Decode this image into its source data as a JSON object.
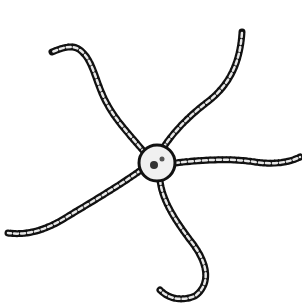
{
  "image": {
    "subject": "Brittle star illustration",
    "background": "#ffffff",
    "ink_color": "#111111",
    "disc": {
      "cx": 157,
      "cy": 163,
      "r": 18
    },
    "arms": [
      {
        "name": "upper-left",
        "path": "M145,153 C130,135 115,120 105,100 C95,80 93,60 80,50 C72,44 62,48 52,52"
      },
      {
        "name": "upper-right",
        "path": "M163,148 C175,130 190,115 210,100 C228,85 240,65 242,32"
      },
      {
        "name": "right",
        "path": "M175,163 C200,160 230,158 255,162 C275,165 290,162 300,157"
      },
      {
        "name": "lower",
        "path": "M160,180 C162,200 175,220 190,240 C210,265 210,285 195,296 C180,302 168,298 160,290"
      },
      {
        "name": "lower-left",
        "path": "M141,170 C120,185 95,200 70,215 C50,228 30,236 8,233"
      }
    ]
  }
}
